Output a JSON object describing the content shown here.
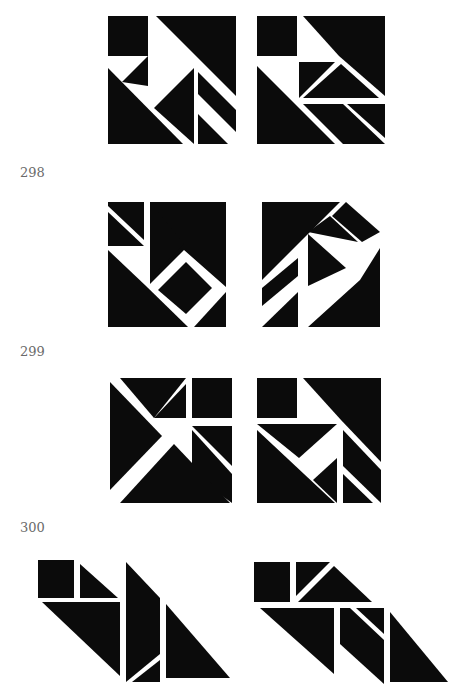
{
  "page": {
    "background": "#ffffff",
    "ink_color": "#0b0b0b",
    "label_color": "#6a6a6a"
  },
  "problems": [
    {
      "number": "",
      "figures": [
        "tangram-square-a",
        "tangram-square-b"
      ]
    },
    {
      "number": "298",
      "figures": [
        "tangram-square-with-hole",
        "tangram-square-with-gap"
      ]
    },
    {
      "number": "299",
      "figures": [
        "tangram-square-with-wedge",
        "tangram-square-with-notch"
      ]
    },
    {
      "number": "300",
      "figures": [
        "tangram-parallelogram-a",
        "tangram-parallelogram-b"
      ]
    }
  ]
}
